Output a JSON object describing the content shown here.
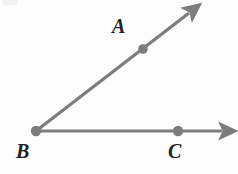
{
  "figure": {
    "canvas": {
      "width": 238,
      "height": 174,
      "background": "#fdfdfd"
    },
    "style": {
      "stroke_color": "#7c7c7c",
      "stroke_width": 3.2,
      "dot_color": "#7c7c7c",
      "label_color": "#232323",
      "label_font_size": 20
    },
    "vertex": {
      "name": "B",
      "label": "B",
      "x": 36,
      "y": 131,
      "dot_radius": 5.2,
      "label_x": 16,
      "label_y": 141
    },
    "points": [
      {
        "name": "A",
        "label": "A",
        "x": 143,
        "y": 49,
        "dot_radius": 4.8,
        "label_x": 112,
        "label_y": 16
      },
      {
        "name": "C",
        "label": "C",
        "x": 178,
        "y": 131,
        "dot_radius": 5.2,
        "label_x": 168,
        "label_y": 141
      }
    ],
    "rays": [
      {
        "name": "ray-BA",
        "from": "B",
        "through": "A",
        "x1": 36,
        "y1": 131,
        "x2": 196,
        "y2": 8,
        "arrowhead": true
      },
      {
        "name": "ray-BC",
        "from": "B",
        "through": "C",
        "x1": 36,
        "y1": 131,
        "x2": 230,
        "y2": 131,
        "arrowhead": true
      }
    ]
  }
}
